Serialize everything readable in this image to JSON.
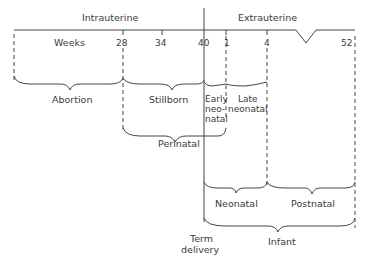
{
  "headers": {
    "intrauterine": "Intrauterine",
    "extrauterine": "Extrauterine"
  },
  "axis": {
    "unit_label": "Weeks",
    "ticks": [
      {
        "label": "28",
        "x": 123
      },
      {
        "label": "34",
        "x": 162
      },
      {
        "label": "40",
        "x": 204
      },
      {
        "label": "1",
        "x": 226
      },
      {
        "label": "4",
        "x": 267
      },
      {
        "label": "52",
        "x": 355
      }
    ]
  },
  "periods": {
    "abortion": "Abortion",
    "stillborn": "Stillborn",
    "early_neonatal_line1": "Early",
    "early_neonatal_line2": "neo-",
    "early_neonatal_line3": "natal",
    "late_neonatal_line1": "Late",
    "late_neonatal_line2": "neonatal",
    "perinatal": "Perinatal",
    "neonatal": "Neonatal",
    "postnatal": "Postnatal",
    "infant": "Infant",
    "term_delivery_line1": "Term",
    "term_delivery_line2": "delivery"
  },
  "colors": {
    "line": "#444444",
    "text": "#3a3a3a",
    "background": "#ffffff"
  }
}
